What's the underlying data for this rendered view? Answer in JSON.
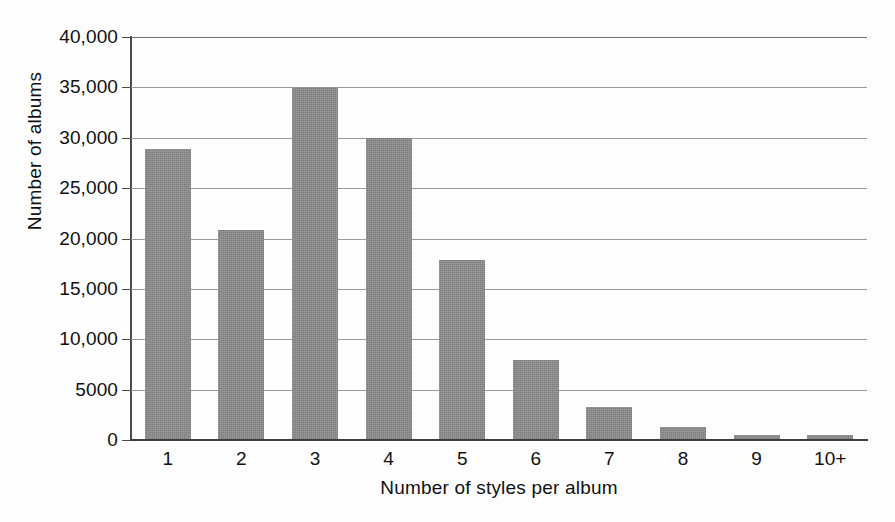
{
  "chart_data": {
    "type": "bar",
    "title": "",
    "xlabel": "Number of styles per album",
    "ylabel": "Number of albums",
    "categories": [
      "1",
      "2",
      "3",
      "4",
      "5",
      "6",
      "7",
      "8",
      "9",
      "10+"
    ],
    "values": [
      28900,
      20800,
      35000,
      30000,
      17900,
      7900,
      3300,
      1300,
      500,
      450
    ],
    "ylim": [
      0,
      40000
    ],
    "ytick_values": [
      0,
      5000,
      10000,
      15000,
      20000,
      25000,
      30000,
      35000,
      40000
    ],
    "ytick_labels": [
      "0",
      "5000",
      "10,000",
      "15,000",
      "20,000",
      "25,000",
      "30,000",
      "35,000",
      "40,000"
    ],
    "grid": true,
    "grid_axis": "y",
    "legend": false,
    "bar_color": "#8b8b8b",
    "background_color": "#fdfdfd",
    "gridline_color": "#9a9a9a",
    "axis_color": "#4c4c4c",
    "text_color": "#111111"
  }
}
